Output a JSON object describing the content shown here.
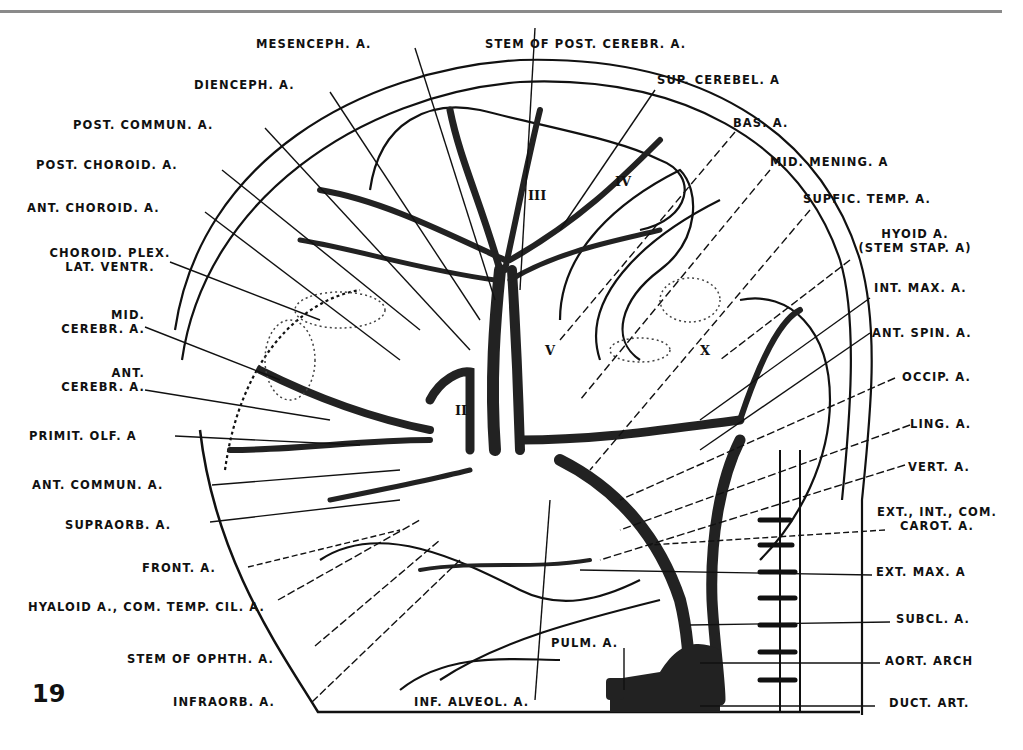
{
  "figure": {
    "number": "19",
    "roman_markers": [
      "III",
      "IV",
      "V",
      "II",
      "X"
    ],
    "labels_top": [
      {
        "id": "mesenceph",
        "text": "MESENCEPH. A."
      },
      {
        "id": "stem-post-cerebr",
        "text": "STEM OF POST. CEREBR. A."
      }
    ],
    "labels_left": [
      {
        "id": "dienceph",
        "text": "DIENCEPH. A."
      },
      {
        "id": "post-commun",
        "text": "POST. COMMUN. A."
      },
      {
        "id": "post-choroid",
        "text": "POST. CHOROID. A."
      },
      {
        "id": "ant-choroid",
        "text": "ANT. CHOROID. A."
      },
      {
        "id": "choroid-plex",
        "text": "CHOROID. PLEX.",
        "text2": "LAT. VENTR."
      },
      {
        "id": "mid-cerebr",
        "text": "MID.",
        "text2": "CEREBR. A."
      },
      {
        "id": "ant-cerebr",
        "text": "ANT.",
        "text2": "CEREBR. A."
      },
      {
        "id": "primit-olf",
        "text": "PRIMIT. OLF. A"
      },
      {
        "id": "ant-commun",
        "text": "ANT. COMMUN. A."
      },
      {
        "id": "supraorb",
        "text": "SUPRAORB. A."
      },
      {
        "id": "front",
        "text": "FRONT. A."
      },
      {
        "id": "hyaloid",
        "text": "HYALOID A., COM. TEMP. CIL. A."
      },
      {
        "id": "stem-ophth",
        "text": "STEM OF OPHTH. A."
      },
      {
        "id": "infraorb",
        "text": "INFRAORB. A."
      }
    ],
    "labels_right": [
      {
        "id": "sup-cerebel",
        "text": "SUP. CEREBEL. A"
      },
      {
        "id": "bas",
        "text": "BAS. A."
      },
      {
        "id": "mid-mening",
        "text": "MID. MENING. A"
      },
      {
        "id": "suppic-temp",
        "text": "SUPFIC. TEMP. A."
      },
      {
        "id": "hyoid",
        "text": "HYOID A.",
        "text2": "(STEM STAP. A)"
      },
      {
        "id": "int-max",
        "text": "INT. MAX. A."
      },
      {
        "id": "ant-spin",
        "text": "ANT. SPIN. A."
      },
      {
        "id": "occip",
        "text": "OCCIP. A."
      },
      {
        "id": "ling",
        "text": "LING. A."
      },
      {
        "id": "vert",
        "text": "VERT. A."
      },
      {
        "id": "ext-int-com",
        "text": "EXT., INT., COM.",
        "text2": "CAROT. A."
      },
      {
        "id": "ext-max",
        "text": "EXT. MAX. A"
      },
      {
        "id": "subcl",
        "text": "SUBCL. A."
      },
      {
        "id": "aort-arch",
        "text": "AORT. ARCH"
      },
      {
        "id": "duct-art",
        "text": "DUCT. ART."
      }
    ],
    "labels_bottom": [
      {
        "id": "inf-alveol",
        "text": "INF. ALVEOL. A."
      },
      {
        "id": "pulm",
        "text": "PULM. A."
      }
    ]
  }
}
